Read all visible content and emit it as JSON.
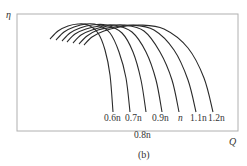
{
  "chart_data": {
    "type": "line",
    "title": "",
    "caption": "(b)",
    "xlabel": "Q",
    "ylabel": "η",
    "grid": false,
    "legend_position": "inline-bottom",
    "series": [
      {
        "name": "0.6n",
        "points": [
          [
            50,
            39
          ],
          [
            58,
            31
          ],
          [
            68,
            26
          ],
          [
            78,
            24
          ],
          [
            88,
            25
          ],
          [
            98,
            33
          ],
          [
            105,
            50
          ],
          [
            110,
            75
          ],
          [
            113,
            112
          ]
        ]
      },
      {
        "name": "0.7n",
        "points": [
          [
            56,
            40
          ],
          [
            64,
            32
          ],
          [
            74,
            27
          ],
          [
            86,
            24
          ],
          [
            98,
            25
          ],
          [
            110,
            33
          ],
          [
            119,
            52
          ],
          [
            126,
            78
          ],
          [
            130,
            112
          ]
        ]
      },
      {
        "name": "0.8n",
        "points": [
          [
            62,
            41
          ],
          [
            70,
            33
          ],
          [
            80,
            28
          ],
          [
            92,
            25
          ],
          [
            106,
            25
          ],
          [
            122,
            33
          ],
          [
            133,
            52
          ],
          [
            141,
            80
          ],
          [
            146,
            112
          ]
        ]
      },
      {
        "name": "0.9n",
        "points": [
          [
            67,
            42
          ],
          [
            75,
            34
          ],
          [
            86,
            29
          ],
          [
            100,
            26
          ],
          [
            114,
            25
          ],
          [
            132,
            32
          ],
          [
            146,
            52
          ],
          [
            156,
            80
          ],
          [
            162,
            112
          ]
        ]
      },
      {
        "name": "n",
        "points": [
          [
            73,
            43
          ],
          [
            81,
            35
          ],
          [
            92,
            30
          ],
          [
            108,
            26
          ],
          [
            124,
            25
          ],
          [
            144,
            31
          ],
          [
            160,
            52
          ],
          [
            172,
            80
          ],
          [
            179,
            112
          ]
        ]
      },
      {
        "name": "1.1n",
        "points": [
          [
            79,
            44
          ],
          [
            87,
            36
          ],
          [
            98,
            30
          ],
          [
            114,
            27
          ],
          [
            132,
            25
          ],
          [
            154,
            30
          ],
          [
            174,
            50
          ],
          [
            188,
            80
          ],
          [
            196,
            112
          ]
        ]
      },
      {
        "name": "1.2n",
        "points": [
          [
            84,
            45
          ],
          [
            92,
            37
          ],
          [
            104,
            31
          ],
          [
            120,
            27
          ],
          [
            140,
            25
          ],
          [
            164,
            29
          ],
          [
            188,
            48
          ],
          [
            204,
            78
          ],
          [
            213,
            112
          ]
        ]
      }
    ],
    "annotations": [
      {
        "text": "0.6n",
        "x": 104,
        "y": 114
      },
      {
        "text": "0.7n",
        "x": 125,
        "y": 114
      },
      {
        "text": "0.8n",
        "x": 134,
        "y": 131
      },
      {
        "text": "0.9n",
        "x": 152,
        "y": 114
      },
      {
        "text": "n",
        "x": 178,
        "y": 114
      },
      {
        "text": "1.1n",
        "x": 190,
        "y": 114
      },
      {
        "text": "1.2n",
        "x": 208,
        "y": 114
      }
    ],
    "frame": {
      "left": 17,
      "top": 14,
      "right": 238,
      "bottom": 131
    },
    "line_color": "#2a2a2a",
    "frame_color": "#b0b0b0"
  },
  "labels": {
    "y_axis": "η",
    "x_axis": "Q",
    "caption": "(b)",
    "speed_0_6": "0.6n",
    "speed_0_7": "0.7n",
    "speed_0_8": "0.8n",
    "speed_0_9": "0.9n",
    "speed_1_0": "n",
    "speed_1_1": "1.1n",
    "speed_1_2": "1.2n"
  }
}
